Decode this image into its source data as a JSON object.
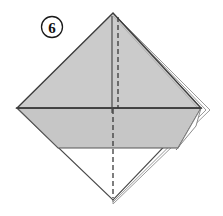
{
  "figure": {
    "kind": "origami-fold-diagram",
    "step_number": "6",
    "canvas": {
      "width": 223,
      "height": 216
    },
    "background_color": "#ffffff"
  },
  "step_badge": {
    "label": "6",
    "shape": "circle",
    "center": {
      "x": 52,
      "y": 27
    },
    "radius": 10,
    "stroke_color": "#1a1a1a",
    "text_color": "#111111"
  },
  "palette": {
    "paper_front": "#cbcbcb",
    "paper_front_shade": "#c2c2c2",
    "paper_back": "#ffffff",
    "outline": "#3c3c3c",
    "outline_soft": "#8a8a8a",
    "crease_dashed": "#3a3a3a",
    "crease_solid": "#4a4a4a"
  },
  "geometry": {
    "top_apex": {
      "x": 113,
      "y": 13
    },
    "left_corner": {
      "x": 17,
      "y": 108
    },
    "right_corner": {
      "x": 201,
      "y": 108
    },
    "bottom_apex": {
      "x": 113,
      "y": 200
    },
    "gray_lower_edge_y": 148,
    "horizontal_crease_y": 108,
    "vertical_crease_x": 113
  },
  "elements": [
    {
      "name": "upper-gray-triangle",
      "description": "Large shaded triangle from top apex down to the horizontal mid line",
      "fill": "#cbcbcb"
    },
    {
      "name": "lower-gray-band",
      "description": "Shaded band between the mid horizontal line and the lower flap edge",
      "fill": "#c6c6c6"
    },
    {
      "name": "lower-white-triangle",
      "description": "Unshaded (reverse side) triangle at bottom of the diamond",
      "fill": "#ffffff"
    },
    {
      "name": "right-layer-sliver",
      "description": "Thin offset layer edges visible along the right side",
      "fill": "#ffffff"
    }
  ],
  "creases": [
    {
      "name": "vertical-dashed-crease-upper",
      "style": "dashed",
      "orientation": "vertical",
      "from": {
        "x": 118,
        "y": 16
      },
      "to": {
        "x": 118,
        "y": 108
      }
    },
    {
      "name": "vertical-solid-crease-upper",
      "style": "solid",
      "orientation": "vertical",
      "from": {
        "x": 112,
        "y": 16
      },
      "to": {
        "x": 112,
        "y": 112
      }
    },
    {
      "name": "vertical-dashed-crease-lower",
      "style": "dashed",
      "orientation": "vertical",
      "from": {
        "x": 113,
        "y": 110
      },
      "to": {
        "x": 113,
        "y": 198
      }
    },
    {
      "name": "horizontal-mid-crease",
      "style": "solid",
      "orientation": "horizontal",
      "from": {
        "x": 18,
        "y": 108
      },
      "to": {
        "x": 200,
        "y": 108
      }
    },
    {
      "name": "lower-flap-edge",
      "style": "solid",
      "orientation": "horizontal",
      "from": {
        "x": 58,
        "y": 148
      },
      "to": {
        "x": 178,
        "y": 148
      }
    }
  ],
  "legend": {
    "dashed_meaning": "valley fold / existing crease line",
    "solid_meaning": "paper edge"
  }
}
